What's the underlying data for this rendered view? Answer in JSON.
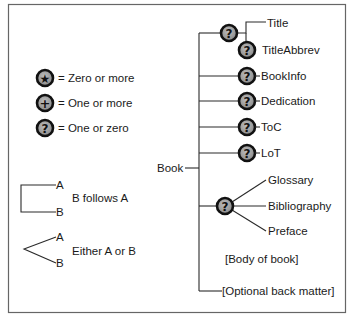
{
  "legend": {
    "symbols": [
      {
        "icon": "star-icon",
        "glyph": "★",
        "label": "= Zero or more"
      },
      {
        "icon": "plus-icon",
        "glyph": "+",
        "label": "= One or more"
      },
      {
        "icon": "question-icon",
        "glyph": "?",
        "label": "= One or zero"
      }
    ],
    "sequence": {
      "a": "A",
      "b": "B",
      "label": "B follows A"
    },
    "choice": {
      "a": "A",
      "b": "B",
      "label": "Either A or B"
    }
  },
  "tree": {
    "root": "Book",
    "node_glyph": "?",
    "title_group": {
      "title": "Title",
      "title_abbrev": "TitleAbbrev"
    },
    "optional_children": [
      "BookInfo",
      "Dedication",
      "ToC",
      "LoT"
    ],
    "choice_group": [
      "Glossary",
      "Bibliography",
      "Preface"
    ],
    "body": "[Body of book]",
    "back_matter": "[Optional back matter]"
  },
  "colors": {
    "node_fill": "#9a9a9a",
    "node_border": "#111111",
    "frame": "#555555"
  }
}
